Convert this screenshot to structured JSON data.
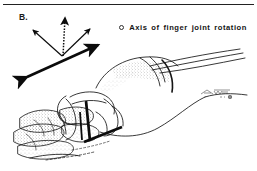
{
  "figure": {
    "panel_label": "B.",
    "caption_note": "",
    "background_color": "#ffffff",
    "ink_color": "#111111",
    "width": 257,
    "height": 171
  },
  "legend": {
    "marker_icon": "small-open-circle-marker",
    "marker_color": "#303030",
    "text": "Axis  of  finger  joint  rotation"
  },
  "axis_diagram": {
    "name": "rotation-axis-arrow-cluster",
    "origin": {
      "x": 62,
      "y": 56
    },
    "arrows": [
      {
        "id": "thick-double-arrow",
        "style": "solid-thick-double-headed",
        "from": {
          "x": 24,
          "y": 79
        },
        "to": {
          "x": 100,
          "y": 44
        },
        "stroke_width": 2.6,
        "color": "#111111"
      },
      {
        "id": "thin-arrow-upper-left",
        "style": "solid-thin-single-headed",
        "from": {
          "x": 62,
          "y": 56
        },
        "to": {
          "x": 32,
          "y": 29
        },
        "stroke_width": 1.1,
        "color": "#111111"
      },
      {
        "id": "thin-arrow-upper-right",
        "style": "solid-thin-single-headed",
        "from": {
          "x": 62,
          "y": 56
        },
        "to": {
          "x": 91,
          "y": 28
        },
        "stroke_width": 1.1,
        "color": "#111111"
      },
      {
        "id": "dashed-arrow-vertical",
        "style": "dashed-single-headed",
        "from": {
          "x": 63,
          "y": 56
        },
        "to": {
          "x": 65,
          "y": 16
        },
        "stroke_width": 1.3,
        "color": "#111111"
      }
    ]
  },
  "hand_illustration": {
    "name": "line-art-hand-dorsal-view",
    "description": "Stippled pen-and-ink drawing of a hand with fingers at lower left and wrist / forearm extending to the right",
    "overlay_axis_lines": [
      {
        "id": "axis-line-vertical",
        "from": {
          "x": 86,
          "y": 101
        },
        "to": {
          "x": 90,
          "y": 140
        },
        "stroke_width": 2.6
      },
      {
        "id": "axis-line-diagonal",
        "from": {
          "x": 84,
          "y": 141
        },
        "to": {
          "x": 122,
          "y": 127
        },
        "stroke_width": 2.6
      }
    ],
    "signature_mark": "illegible-artist-signature"
  }
}
